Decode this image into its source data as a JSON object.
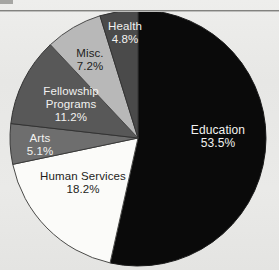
{
  "page": {
    "background_color": "#e9e9e7",
    "rule_color": "#6e6e6c"
  },
  "chart_data": {
    "type": "pie",
    "title": "",
    "subtitle": "",
    "xlabel": "",
    "ylabel": "",
    "legend_position": "none",
    "labels_inside_slices": true,
    "total_percent": "100.0%",
    "categories": [
      "Education",
      "Human Services",
      "Fellowship Programs",
      "Misc.",
      "Arts",
      "Health"
    ],
    "values": [
      53.5,
      18.2,
      11.2,
      7.2,
      5.1,
      4.8
    ],
    "slices": [
      {
        "name": "Education",
        "label": "Education",
        "value": 53.5,
        "value_text": "53.5%",
        "color": "#0a0a0a",
        "text_color": "#f2f2f0",
        "start_angle": 0,
        "end_angle": 192.6
      },
      {
        "name": "Human Services",
        "label": "Human Services",
        "value": 18.2,
        "value_text": "18.2%",
        "color": "#fbfbf9",
        "text_color": "#1d1d1b",
        "start_angle": 192.6,
        "end_angle": 258.1
      },
      {
        "name": "Arts",
        "label": "Arts",
        "value": 5.1,
        "value_text": "5.1%",
        "color": "#6e6e6e",
        "text_color": "#f2f2f0",
        "start_angle": 258.1,
        "end_angle": 276.5
      },
      {
        "name": "Fellowship Programs",
        "label": "Fellowship",
        "label_line2": "Programs",
        "value": 11.2,
        "value_text": "11.2%",
        "color": "#585858",
        "text_color": "#f2f2f0",
        "start_angle": 276.5,
        "end_angle": 316.8
      },
      {
        "name": "Misc.",
        "label": "Misc.",
        "value": 7.2,
        "value_text": "7.2%",
        "color": "#b8b8b8",
        "text_color": "#1d1d1b",
        "start_angle": 316.8,
        "end_angle": 342.7
      },
      {
        "name": "Health",
        "label": "Health",
        "value": 4.8,
        "value_text": "4.8%",
        "color": "#4a4a4a",
        "text_color": "#f2f2f0",
        "start_angle": 342.7,
        "end_angle": 360
      }
    ]
  }
}
